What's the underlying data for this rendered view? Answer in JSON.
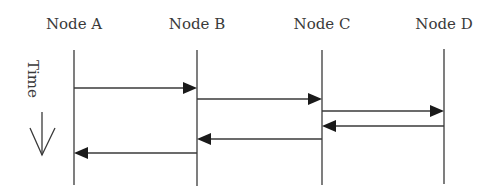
{
  "diagram": {
    "type": "sequence",
    "nodes": [
      {
        "label": "Node A",
        "x": 74
      },
      {
        "label": "Node B",
        "x": 197
      },
      {
        "label": "Node C",
        "x": 322
      },
      {
        "label": "Node D",
        "x": 444
      }
    ],
    "time_axis": {
      "label": "Time",
      "direction": "down"
    },
    "messages": [
      {
        "from": "Node A",
        "to": "Node B",
        "y": 88
      },
      {
        "from": "Node B",
        "to": "Node C",
        "y": 99
      },
      {
        "from": "Node C",
        "to": "Node D",
        "y": 111
      },
      {
        "from": "Node D",
        "to": "Node C",
        "y": 126
      },
      {
        "from": "Node C",
        "to": "Node B",
        "y": 139
      },
      {
        "from": "Node B",
        "to": "Node A",
        "y": 153
      }
    ],
    "colors": {
      "line": "#3a3a3a",
      "text": "#3a3a3a"
    }
  }
}
